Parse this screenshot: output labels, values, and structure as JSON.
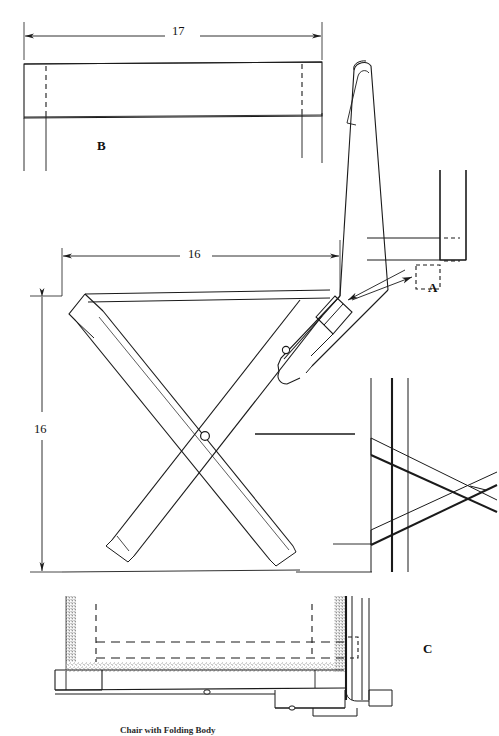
{
  "drawing": {
    "title": "Folding Chair Plan",
    "caption": "Chair with Folding Body",
    "line_color": "#1a1a1a",
    "background_color": "#ffffff",
    "stipple_color": "#555555"
  },
  "dimensions": [
    {
      "id": "back-width",
      "value": "17",
      "orientation": "horizontal",
      "view": "B"
    },
    {
      "id": "seat-depth",
      "value": "16",
      "orientation": "horizontal",
      "view": "side-elevation"
    },
    {
      "id": "seat-height",
      "value": "16",
      "orientation": "vertical",
      "view": "side-elevation"
    }
  ],
  "part_labels": [
    {
      "id": "A",
      "text": "A",
      "view": "joint-detail"
    },
    {
      "id": "B",
      "text": "B",
      "view": "top-rail-view"
    },
    {
      "id": "C",
      "text": "C",
      "view": "seat-section-detail"
    }
  ],
  "views": {
    "top_rail": {
      "name": "B",
      "description": "Top view of seat rail with dashed tenon lines",
      "width_label": "17"
    },
    "side_elevation": {
      "name": "main",
      "description": "Side elevation of folding chair with scissor X legs and pivot bolts",
      "depth_label": "16",
      "height_label": "16"
    },
    "joint_detail": {
      "name": "A",
      "description": "Enlarged joint detail showing dashed mortise pocket in leg post"
    },
    "end_view": {
      "name": "end",
      "description": "End view of crossed leg assembly against stiles"
    },
    "seat_section": {
      "name": "C",
      "description": "Cross section of seat frame with stippled upholstery and dashed hidden edges"
    }
  }
}
